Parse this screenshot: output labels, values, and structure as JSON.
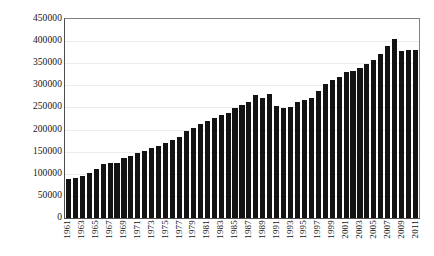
{
  "chart_data": {
    "type": "bar",
    "title": "",
    "subtitle": "",
    "xlabel": "",
    "ylabel": "",
    "ylim": [
      0,
      450000
    ],
    "ytick_step": 50000,
    "ytick_labels": [
      "450000",
      "400000",
      "350000",
      "300000",
      "250000",
      "200000",
      "150000",
      "100000",
      "50000",
      "0"
    ],
    "ytick_values": [
      450000,
      400000,
      350000,
      300000,
      250000,
      200000,
      150000,
      100000,
      50000,
      0
    ],
    "grid": true,
    "grid_axis": "y",
    "legend": false,
    "legend_position": "none",
    "bar_color": "#131313",
    "grid_color": "#ededed",
    "axis_color": "#4d4d4d",
    "xtick_label_interval": 2,
    "xtick_label_rotation": 90,
    "categories": [
      "1961",
      "1962",
      "1963",
      "1964",
      "1965",
      "1966",
      "1967",
      "1968",
      "1969",
      "1970",
      "1971",
      "1972",
      "1973",
      "1974",
      "1975",
      "1976",
      "1977",
      "1978",
      "1979",
      "1980",
      "1981",
      "1982",
      "1983",
      "1984",
      "1985",
      "1986",
      "1987",
      "1988",
      "1989",
      "1990",
      "1991",
      "1992",
      "1993",
      "1994",
      "1995",
      "1996",
      "1997",
      "1998",
      "1999",
      "2000",
      "2001",
      "2002",
      "2003",
      "2004",
      "2005",
      "2006",
      "2007",
      "2008",
      "2009",
      "2010",
      "2011"
    ],
    "visible_xtick_labels": [
      "1961",
      "1963",
      "1965",
      "1967",
      "1969",
      "1971",
      "1973",
      "1975",
      "1977",
      "1979",
      "1981",
      "1983",
      "1985",
      "1987",
      "1989",
      "1991",
      "1993",
      "1995",
      "1997",
      "1999",
      "2001",
      "2003",
      "2005",
      "2007",
      "2009",
      "2011"
    ],
    "values": [
      88000,
      91000,
      95000,
      102000,
      110000,
      122000,
      124000,
      125000,
      136000,
      140000,
      146000,
      152000,
      158000,
      163000,
      170000,
      177000,
      184000,
      196000,
      204000,
      213000,
      219000,
      226000,
      232000,
      238000,
      248000,
      255000,
      262000,
      278000,
      272000,
      280000,
      253000,
      248000,
      252000,
      262000,
      266000,
      272000,
      288000,
      304000,
      312000,
      318000,
      330000,
      332000,
      340000,
      348000,
      358000,
      372000,
      390000,
      404000,
      378000,
      381000,
      379000
    ]
  }
}
